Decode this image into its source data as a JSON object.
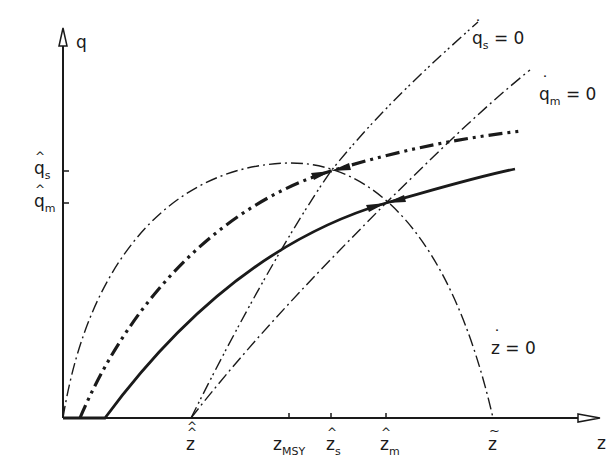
{
  "diagram": {
    "axes": {
      "y_label": "q",
      "x_label": "z",
      "y_ticks": [
        {
          "label": "q",
          "sub": "s",
          "accent": "hat",
          "y": 171
        },
        {
          "label": "q",
          "sub": "m",
          "accent": "hat",
          "y": 203
        }
      ],
      "x_ticks": [
        {
          "label": "z",
          "sub": "",
          "accent": "double-hat",
          "x": 191
        },
        {
          "label": "z",
          "sub": "MSY",
          "accent": "none",
          "x": 289
        },
        {
          "label": "z",
          "sub": "s",
          "accent": "hat",
          "x": 331
        },
        {
          "label": "z",
          "sub": "m",
          "accent": "hat",
          "x": 386
        },
        {
          "label": "z",
          "sub": "",
          "accent": "tilde",
          "x": 493
        }
      ]
    },
    "curve_labels": {
      "qs_dot": {
        "var": "q",
        "sub": "s",
        "eq": " = 0"
      },
      "qm_dot": {
        "var": "q",
        "sub": "m",
        "eq": " = 0"
      },
      "z_dot": {
        "var": "z",
        "sub": "",
        "eq": " = 0"
      }
    },
    "curves": [
      {
        "name": "z-dot-zero",
        "style": "dash-dot",
        "description": "parabola from origin peaking at z_MSY, returning to z-tilde"
      },
      {
        "name": "qs-dot-zero",
        "style": "dash-dot-dot",
        "description": "line from z-double-hat through (z_s-hat, q_s-hat)"
      },
      {
        "name": "qm-dot-zero",
        "style": "dash-dot",
        "description": "line from z-double-hat through (z_m-hat, q_m-hat)"
      },
      {
        "name": "trajectory-s",
        "style": "thick dash-dot-dot",
        "description": "optimal path converging to (z_s-hat, q_s-hat)"
      },
      {
        "name": "trajectory-m",
        "style": "solid thick",
        "description": "optimal path converging to (z_m-hat, q_m-hat)"
      }
    ],
    "colors": {
      "ink": "#1a1a1a",
      "background": "#ffffff"
    }
  }
}
